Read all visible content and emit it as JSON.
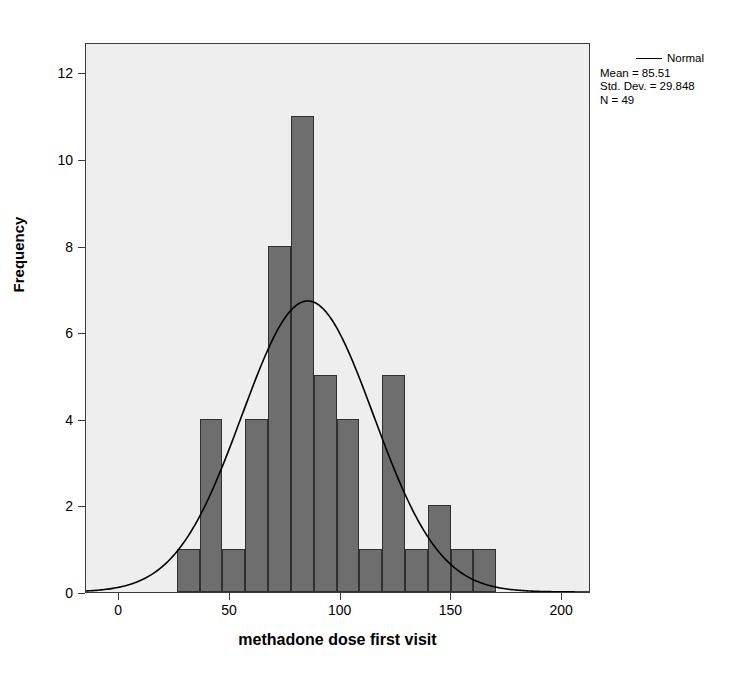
{
  "chart_data": {
    "type": "bar",
    "title": "",
    "subtitle": "",
    "xlabel": "methadone dose first visit",
    "ylabel": "Frequency",
    "xlim": [
      -15,
      213
    ],
    "ylim": [
      0,
      12.7
    ],
    "xticks": [
      "0",
      "50",
      "100",
      "150",
      "200"
    ],
    "xtick_values": [
      0,
      50,
      100,
      150,
      200
    ],
    "yticks": [
      "0",
      "2",
      "4",
      "6",
      "8",
      "10",
      "12"
    ],
    "ytick_values": [
      0,
      2,
      4,
      6,
      8,
      10,
      12
    ],
    "grid": false,
    "bin_width": 10.3,
    "bin_starts": [
      26.0,
      36.3,
      46.6,
      56.9,
      67.2,
      77.5,
      87.8,
      98.1,
      108.4,
      118.7,
      129.0,
      139.3,
      149.6,
      159.9
    ],
    "bin_centers": [
      31.2,
      41.5,
      51.8,
      62.1,
      72.4,
      82.7,
      93.0,
      103.3,
      113.6,
      123.9,
      134.2,
      144.5,
      154.8,
      165.1
    ],
    "values": [
      1,
      4,
      1,
      4,
      8,
      11,
      5,
      4,
      1,
      5,
      1,
      2,
      1,
      1
    ],
    "bar_color": "#6e6e6e",
    "bar_edge_color": "#303030",
    "plot_background": "#eeeeee",
    "overlay": {
      "type": "line",
      "name": "Normal",
      "color": "#000000",
      "mean": 85.51,
      "std_dev": 29.848,
      "n": 49,
      "scale_note": "normal density scaled to histogram counts (peak 6.5)"
    },
    "legend": {
      "position": "top-right-outside",
      "normal_label": "Normal",
      "stats": [
        "Mean = 85.51",
        "Std. Dev. = 29.848",
        "N = 49"
      ]
    }
  }
}
